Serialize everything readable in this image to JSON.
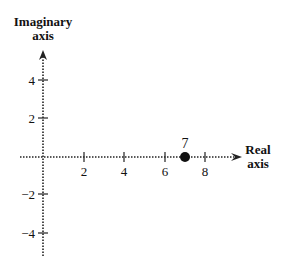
{
  "diagram": {
    "type": "complex-plane",
    "axes": {
      "imaginary_label_line1": "Imaginary",
      "imaginary_label_line2": "axis",
      "real_label_line1": "Real",
      "real_label_line2": "axis"
    },
    "x_ticks": [
      {
        "value": 2,
        "label": "2"
      },
      {
        "value": 4,
        "label": "4"
      },
      {
        "value": 6,
        "label": "6"
      },
      {
        "value": 8,
        "label": "8"
      }
    ],
    "y_ticks": [
      {
        "value": 4,
        "label": "4"
      },
      {
        "value": 2,
        "label": "2"
      },
      {
        "value": -2,
        "label": "−2"
      },
      {
        "value": -4,
        "label": "−4"
      }
    ],
    "point": {
      "real": 7,
      "imaginary": 0,
      "label": "7"
    },
    "colors": {
      "ink": "#111111",
      "background": "#ffffff"
    }
  }
}
